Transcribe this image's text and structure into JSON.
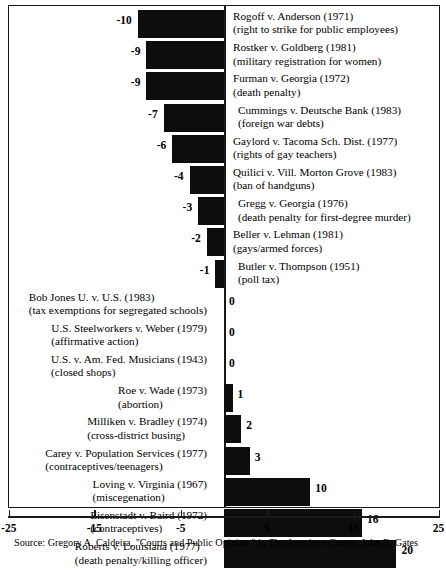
{
  "chart_data": {
    "type": "bar",
    "orientation": "horizontal",
    "title": "",
    "xlabel": "",
    "ylabel": "",
    "xlim": [
      -25,
      25
    ],
    "xticks": [
      -25,
      -15,
      -5,
      5,
      15,
      25
    ],
    "xticklabels": [
      "-25",
      "-15",
      "-5",
      "5",
      "15",
      "25"
    ],
    "grid": false,
    "legend": null,
    "bar_color": "#0d0d0d",
    "categories": [
      "Rogoff v. Anderson (1971)",
      "Rostker v. Goldberg (1981)",
      "Furman v. Georgia (1972)",
      "Cummings v. Deutsche Bank (1983)",
      "Gaylord v. Tacoma Sch. Dist. (1977)",
      "Quilici v. Vill. Morton Grove (1983)",
      "Gregg v. Georgia (1976)",
      "Beller v. Lehman (1981)",
      "Butler v. Thompson (1951)",
      "Bob Jones U. v. U.S. (1983)",
      "U.S. Steelworkers v. Weber (1979)",
      "U.S. v. Am. Fed. Musicians (1943)",
      "Roe v. Wade (1973)",
      "Milliken v. Bradley (1974)",
      "Carey v. Population Services (1977)",
      "Loving v. Virginia (1967)",
      "Eisenstadt v. Baird (1972)",
      "Roberts v. Louisiana (1977)"
    ],
    "values": [
      -10,
      -9,
      -9,
      -7,
      -6,
      -4,
      -3,
      -2,
      -1,
      0,
      0,
      0,
      1,
      2,
      3,
      10,
      16,
      20
    ]
  },
  "rows": [
    {
      "title": "Rogoff v. Anderson (1971)",
      "subtitle": "(right to strike for public employees)",
      "value": -10,
      "value_label": "-10",
      "label_side": "right",
      "indent": false
    },
    {
      "title": "Rostker v. Goldberg (1981)",
      "subtitle": "(military registration for women)",
      "value": -9,
      "value_label": "-9",
      "label_side": "right",
      "indent": false
    },
    {
      "title": "Furman v. Georgia (1972)",
      "subtitle": "(death penalty)",
      "value": -9,
      "value_label": "-9",
      "label_side": "right",
      "indent": false
    },
    {
      "title": "Cummings v. Deutsche Bank (1983)",
      "subtitle": "(foreign war debts)",
      "value": -7,
      "value_label": "-7",
      "label_side": "right",
      "indent": true
    },
    {
      "title": "Gaylord v. Tacoma Sch. Dist. (1977)",
      "subtitle": "(rights of gay teachers)",
      "value": -6,
      "value_label": "-6",
      "label_side": "right",
      "indent": false
    },
    {
      "title": "Quilici v. Vill. Morton Grove (1983)",
      "subtitle": "(ban of handguns)",
      "value": -4,
      "value_label": "-4",
      "label_side": "right",
      "indent": false
    },
    {
      "title": "Gregg v. Georgia (1976)",
      "subtitle": "(death penalty for first-degree murder)",
      "value": -3,
      "value_label": "-3",
      "label_side": "right",
      "indent": true
    },
    {
      "title": "Beller v. Lehman (1981)",
      "subtitle": "(gays/armed forces)",
      "value": -2,
      "value_label": "-2",
      "label_side": "right",
      "indent": false
    },
    {
      "title": "Butler v. Thompson (1951)",
      "subtitle": "(poll tax)",
      "value": -1,
      "value_label": "-1",
      "label_side": "right",
      "indent": true
    },
    {
      "title": "Bob Jones U. v. U.S. (1983)",
      "subtitle": "(tax exemptions for segregated schools)",
      "value": 0,
      "value_label": "0",
      "label_side": "left",
      "indent": false
    },
    {
      "title": "U.S. Steelworkers v. Weber (1979)",
      "subtitle": "(affirmative action)",
      "value": 0,
      "value_label": "0",
      "label_side": "left",
      "indent": true
    },
    {
      "title": "U.S. v. Am. Fed. Musicians (1943)",
      "subtitle": "(closed shops)",
      "value": 0,
      "value_label": "0",
      "label_side": "left",
      "indent": false
    },
    {
      "title": "Roe v. Wade (1973)",
      "subtitle": "(abortion)",
      "value": 1,
      "value_label": "1",
      "label_side": "left",
      "indent": false
    },
    {
      "title": "Milliken v. Bradley (1974)",
      "subtitle": "(cross-district busing)",
      "value": 2,
      "value_label": "2",
      "label_side": "left",
      "indent": false
    },
    {
      "title": "Carey v. Population Services (1977)",
      "subtitle": "(contraceptives/teenagers)",
      "value": 3,
      "value_label": "3",
      "label_side": "left",
      "indent": true
    },
    {
      "title": "Loving v. Virginia (1967)",
      "subtitle": "(miscegenation)",
      "value": 10,
      "value_label": "10",
      "label_side": "left",
      "indent": false
    },
    {
      "title": "Eisenstadt v. Baird (1972)",
      "subtitle": "(contraceptives)",
      "value": 16,
      "value_label": "16",
      "label_side": "left",
      "indent": false
    },
    {
      "title": "Roberts v. Louisiana (1977)",
      "subtitle": "(death penalty/killing officer)",
      "value": 20,
      "value_label": "20",
      "label_side": "left",
      "indent": false
    }
  ],
  "axis": {
    "ticks": [
      {
        "value": -25,
        "label": "-25"
      },
      {
        "value": -15,
        "label": "-15"
      },
      {
        "value": -5,
        "label": "-5"
      },
      {
        "value": 5,
        "label": "5"
      },
      {
        "value": 15,
        "label": "15"
      },
      {
        "value": 25,
        "label": "25"
      }
    ]
  },
  "source": {
    "prefix": "Source: Gregory A. Caldeira, \"Courts and Public Opinion,\" in ",
    "italic": "The American Courts",
    "suffix": ", John B. Gates"
  }
}
